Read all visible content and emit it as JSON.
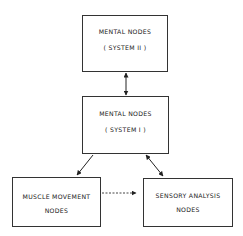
{
  "diagram": {
    "nodes": [
      {
        "id": "mental-system-2",
        "line1": "MENTAL NODES",
        "line2": "( SYSTEM II )"
      },
      {
        "id": "mental-system-1",
        "line1": "MENTAL NODES",
        "line2": "( SYSTEM I )"
      },
      {
        "id": "muscle-movement",
        "line1": "MUSCLE MOVEMENT",
        "line2": "NODES"
      },
      {
        "id": "sensory-analysis",
        "line1": "SENSORY ANALYSIS",
        "line2": "NODES"
      }
    ],
    "edges": [
      {
        "from": "mental-system-2",
        "to": "mental-system-1",
        "style": "solid",
        "direction": "bidirectional"
      },
      {
        "from": "mental-system-1",
        "to": "muscle-movement",
        "style": "solid",
        "direction": "forward"
      },
      {
        "from": "mental-system-1",
        "to": "sensory-analysis",
        "style": "solid",
        "direction": "bidirectional"
      },
      {
        "from": "muscle-movement",
        "to": "sensory-analysis",
        "style": "dashed",
        "direction": "forward"
      }
    ]
  }
}
